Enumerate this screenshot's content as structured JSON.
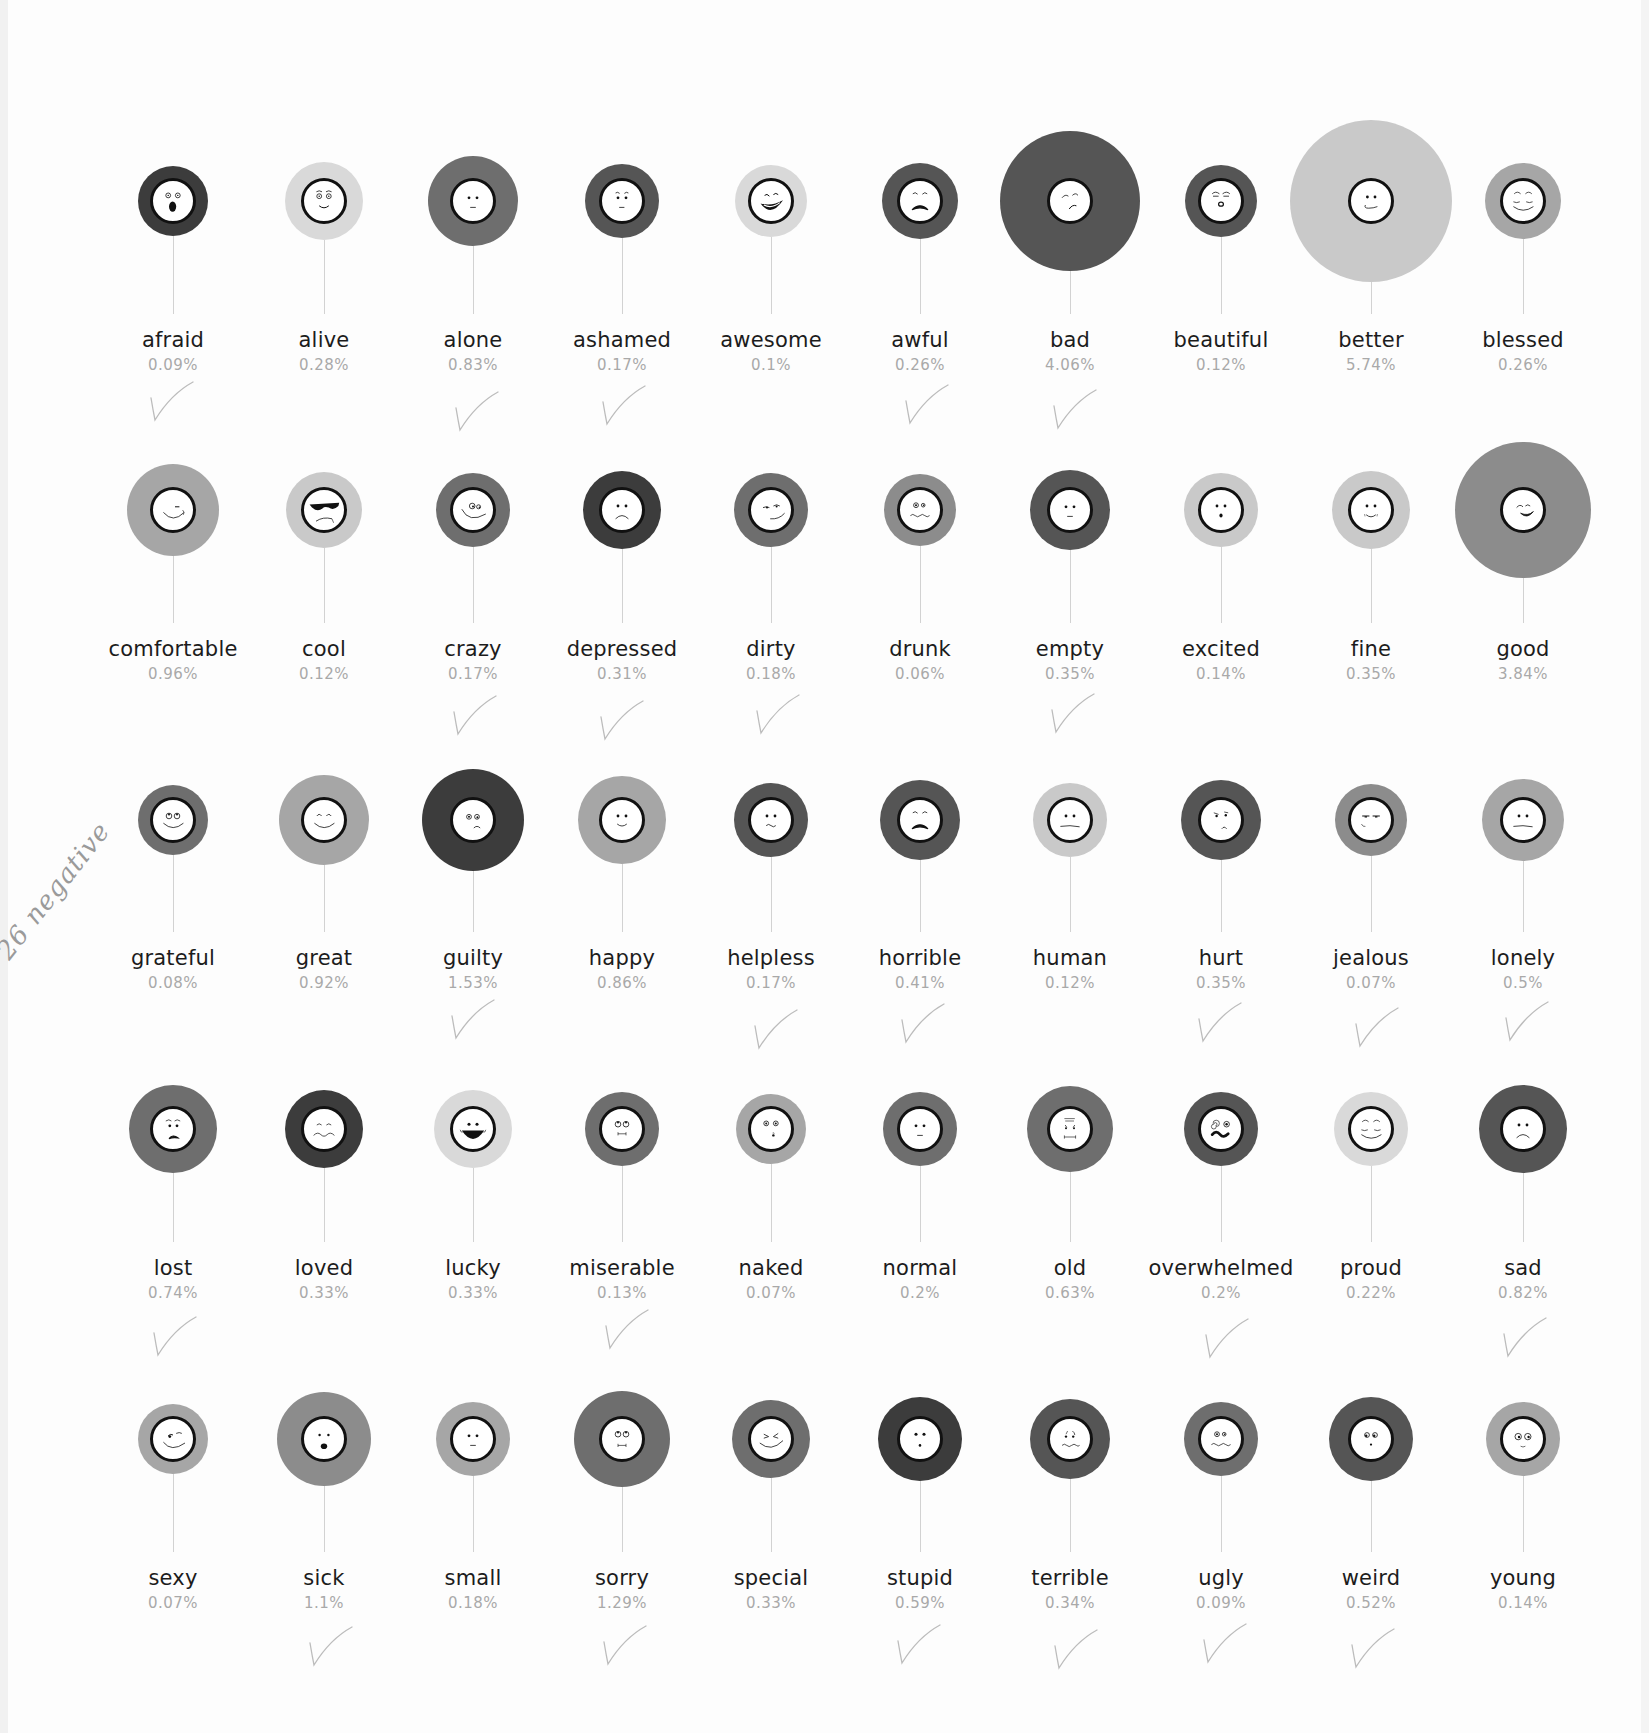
{
  "annotation": {
    "handwritten_note": "26 negative"
  },
  "colors": {
    "dark": "#3c3c3c",
    "darkmid": "#555555",
    "mid": "#6e6e6e",
    "midlight": "#8c8c8c",
    "light": "#a6a6a6",
    "pale": "#c9c9c9",
    "palest": "#d9d9d9",
    "check": "#bcbcbc"
  },
  "chart_data": {
    "type": "bubble-grid",
    "title": "",
    "columns": 10,
    "rows": 5,
    "items": [
      {
        "word": "afraid",
        "pct": "0.09%",
        "value": 0.09,
        "r": 35,
        "shade": "dark",
        "face": "scared",
        "checked": true
      },
      {
        "word": "alive",
        "pct": "0.28%",
        "value": 0.28,
        "r": 39,
        "shade": "palest",
        "face": "wide-smile",
        "checked": false
      },
      {
        "word": "alone",
        "pct": "0.83%",
        "value": 0.83,
        "r": 45,
        "shade": "mid",
        "face": "neutral",
        "checked": true
      },
      {
        "word": "ashamed",
        "pct": "0.17%",
        "value": 0.17,
        "r": 37,
        "shade": "darkmid",
        "face": "worried",
        "checked": true
      },
      {
        "word": "awesome",
        "pct": "0.1%",
        "value": 0.1,
        "r": 36,
        "shade": "palest",
        "face": "laugh",
        "checked": false
      },
      {
        "word": "awful",
        "pct": "0.26%",
        "value": 0.26,
        "r": 38,
        "shade": "darkmid",
        "face": "frown-open",
        "checked": true
      },
      {
        "word": "bad",
        "pct": "4.06%",
        "value": 4.06,
        "r": 70,
        "shade": "darkmid",
        "face": "smirk-sad",
        "checked": true
      },
      {
        "word": "beautiful",
        "pct": "0.12%",
        "value": 0.12,
        "r": 36,
        "shade": "darkmid",
        "face": "kiss",
        "checked": false
      },
      {
        "word": "better",
        "pct": "5.74%",
        "value": 5.74,
        "r": 81,
        "shade": "pale",
        "face": "smirk",
        "checked": false
      },
      {
        "word": "blessed",
        "pct": "0.26%",
        "value": 0.26,
        "r": 38,
        "shade": "light",
        "face": "serene",
        "checked": false
      },
      {
        "word": "comfortable",
        "pct": "0.96%",
        "value": 0.96,
        "r": 46,
        "shade": "light",
        "face": "wink-smile",
        "checked": false
      },
      {
        "word": "cool",
        "pct": "0.12%",
        "value": 0.12,
        "r": 38,
        "shade": "pale",
        "face": "sunglasses",
        "checked": false
      },
      {
        "word": "crazy",
        "pct": "0.17%",
        "value": 0.17,
        "r": 37,
        "shade": "mid",
        "face": "crazy",
        "checked": true
      },
      {
        "word": "depressed",
        "pct": "0.31%",
        "value": 0.31,
        "r": 39,
        "shade": "dark",
        "face": "sad",
        "checked": true
      },
      {
        "word": "dirty",
        "pct": "0.18%",
        "value": 0.18,
        "r": 37,
        "shade": "mid",
        "face": "sly",
        "checked": true
      },
      {
        "word": "drunk",
        "pct": "0.06%",
        "value": 0.06,
        "r": 36,
        "shade": "midlight",
        "face": "woozy",
        "checked": false
      },
      {
        "word": "empty",
        "pct": "0.35%",
        "value": 0.35,
        "r": 40,
        "shade": "darkmid",
        "face": "neutral",
        "checked": true
      },
      {
        "word": "excited",
        "pct": "0.14%",
        "value": 0.14,
        "r": 37,
        "shade": "pale",
        "face": "surprised",
        "checked": false
      },
      {
        "word": "fine",
        "pct": "0.35%",
        "value": 0.35,
        "r": 39,
        "shade": "pale",
        "face": "slight-smile",
        "checked": false
      },
      {
        "word": "good",
        "pct": "3.84%",
        "value": 3.84,
        "r": 68,
        "shade": "midlight",
        "face": "grin-wink",
        "checked": false
      },
      {
        "word": "grateful",
        "pct": "0.08%",
        "value": 0.08,
        "r": 35,
        "shade": "mid",
        "face": "eyes-up-smile",
        "checked": false
      },
      {
        "word": "great",
        "pct": "0.92%",
        "value": 0.92,
        "r": 45,
        "shade": "light",
        "face": "happy-closed",
        "checked": false
      },
      {
        "word": "guilty",
        "pct": "1.53%",
        "value": 1.53,
        "r": 51,
        "shade": "dark",
        "face": "guilty",
        "checked": true
      },
      {
        "word": "happy",
        "pct": "0.86%",
        "value": 0.86,
        "r": 44,
        "shade": "light",
        "face": "smile",
        "checked": false
      },
      {
        "word": "helpless",
        "pct": "0.17%",
        "value": 0.17,
        "r": 37,
        "shade": "darkmid",
        "face": "wavy",
        "checked": true
      },
      {
        "word": "horrible",
        "pct": "0.41%",
        "value": 0.41,
        "r": 40,
        "shade": "darkmid",
        "face": "frown-open",
        "checked": true
      },
      {
        "word": "human",
        "pct": "0.12%",
        "value": 0.12,
        "r": 37,
        "shade": "pale",
        "face": "flat",
        "checked": false
      },
      {
        "word": "hurt",
        "pct": "0.35%",
        "value": 0.35,
        "r": 40,
        "shade": "darkmid",
        "face": "hurt",
        "checked": true
      },
      {
        "word": "jealous",
        "pct": "0.07%",
        "value": 0.07,
        "r": 36,
        "shade": "midlight",
        "face": "jealous",
        "checked": true
      },
      {
        "word": "lonely",
        "pct": "0.5%",
        "value": 0.5,
        "r": 41,
        "shade": "light",
        "face": "flat",
        "checked": true
      },
      {
        "word": "lost",
        "pct": "0.74%",
        "value": 0.74,
        "r": 44,
        "shade": "mid",
        "face": "lost",
        "checked": true
      },
      {
        "word": "loved",
        "pct": "0.33%",
        "value": 0.33,
        "r": 39,
        "shade": "dark",
        "face": "loved",
        "checked": false
      },
      {
        "word": "lucky",
        "pct": "0.33%",
        "value": 0.33,
        "r": 39,
        "shade": "palest",
        "face": "big-grin",
        "checked": false
      },
      {
        "word": "miserable",
        "pct": "0.13%",
        "value": 0.13,
        "r": 37,
        "shade": "mid",
        "face": "miserable",
        "checked": true
      },
      {
        "word": "naked",
        "pct": "0.07%",
        "value": 0.07,
        "r": 35,
        "shade": "light",
        "face": "naked",
        "checked": false
      },
      {
        "word": "normal",
        "pct": "0.2%",
        "value": 0.2,
        "r": 37,
        "shade": "mid",
        "face": "neutral",
        "checked": false
      },
      {
        "word": "old",
        "pct": "0.63%",
        "value": 0.63,
        "r": 43,
        "shade": "mid",
        "face": "old",
        "checked": false
      },
      {
        "word": "overwhelmed",
        "pct": "0.2%",
        "value": 0.2,
        "r": 37,
        "shade": "darkmid",
        "face": "dizzy",
        "checked": true
      },
      {
        "word": "proud",
        "pct": "0.22%",
        "value": 0.22,
        "r": 37,
        "shade": "palest",
        "face": "serene",
        "checked": false
      },
      {
        "word": "sad",
        "pct": "0.82%",
        "value": 0.82,
        "r": 44,
        "shade": "darkmid",
        "face": "sad",
        "checked": true
      },
      {
        "word": "sexy",
        "pct": "0.07%",
        "value": 0.07,
        "r": 35,
        "shade": "light",
        "face": "sexy",
        "checked": false
      },
      {
        "word": "sick",
        "pct": "1.1%",
        "value": 1.1,
        "r": 47,
        "shade": "midlight",
        "face": "scared-small",
        "checked": true
      },
      {
        "word": "small",
        "pct": "0.18%",
        "value": 0.18,
        "r": 37,
        "shade": "light",
        "face": "neutral",
        "checked": false
      },
      {
        "word": "sorry",
        "pct": "1.29%",
        "value": 1.29,
        "r": 48,
        "shade": "mid",
        "face": "sorry",
        "checked": true
      },
      {
        "word": "special",
        "pct": "0.33%",
        "value": 0.33,
        "r": 39,
        "shade": "mid",
        "face": "squint-smile",
        "checked": false
      },
      {
        "word": "stupid",
        "pct": "0.59%",
        "value": 0.59,
        "r": 42,
        "shade": "dark",
        "face": "stupid",
        "checked": true
      },
      {
        "word": "terrible",
        "pct": "0.34%",
        "value": 0.34,
        "r": 40,
        "shade": "darkmid",
        "face": "terrible",
        "checked": true
      },
      {
        "word": "ugly",
        "pct": "0.09%",
        "value": 0.09,
        "r": 37,
        "shade": "mid",
        "face": "woozy",
        "checked": true
      },
      {
        "word": "weird",
        "pct": "0.52%",
        "value": 0.52,
        "r": 42,
        "shade": "darkmid",
        "face": "weird",
        "checked": true
      },
      {
        "word": "young",
        "pct": "0.14%",
        "value": 0.14,
        "r": 37,
        "shade": "light",
        "face": "young",
        "checked": false
      }
    ]
  },
  "layout": {
    "col_x": [
      173,
      324,
      473,
      622,
      771,
      920,
      1070,
      1221,
      1371,
      1523
    ],
    "row_circle_y": [
      201,
      510,
      820,
      1129,
      1439
    ],
    "row_label_y": [
      328,
      637,
      946,
      1256,
      1566
    ],
    "face_r": 23
  }
}
